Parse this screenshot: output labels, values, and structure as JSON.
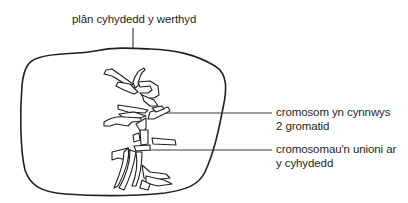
{
  "diagram": {
    "type": "cell-metaphase",
    "colors": {
      "stroke": "#231f20",
      "leader": "#3a3a3a",
      "background": "#ffffff"
    },
    "labels": {
      "equatorial_plane": "plân cyhydedd y werthyd",
      "chromosome_line1": "cromosom yn cynnwys",
      "chromosome_line2": "2 gromatid",
      "aligned_line1": "cromosomau'n unioni ar",
      "aligned_line2": "y cyhydedd"
    }
  }
}
